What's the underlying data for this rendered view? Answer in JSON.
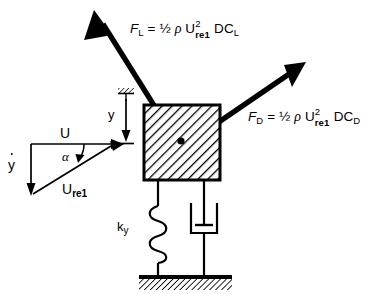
{
  "figure": {
    "type": "free-body-diagram",
    "background_color": "#ffffff",
    "line_color": "#000000"
  },
  "forces": {
    "lift": {
      "name": "lift-force",
      "symbol": "F",
      "symbol_sub": "L",
      "equals": "=",
      "half": "½",
      "rho": "ρ",
      "velocity": "U",
      "velocity_sup": "2",
      "velocity_sub": "re1",
      "tail": "DC",
      "tail_sub": "L",
      "full_text": "F_L = ½ ρ U²_re1 DC_L",
      "direction": "up-left"
    },
    "drag": {
      "name": "drag-force",
      "symbol": "F",
      "symbol_sub": "D",
      "equals": "=",
      "half": "½",
      "rho": "ρ",
      "velocity": "U",
      "velocity_sup": "2",
      "velocity_sub": "re1",
      "tail": "DC",
      "tail_sub": "D",
      "full_text": "F_D = ½ ρ U²_re1 DC_D",
      "direction": "up-right"
    }
  },
  "velocity_triangle": {
    "free_stream": {
      "label": "U",
      "description": "horizontal-free-stream-velocity"
    },
    "body_velocity": {
      "label": "y",
      "has_overdot": true,
      "description": "vertical-body-velocity-y-dot"
    },
    "relative_velocity": {
      "label": "U",
      "sub": "re1",
      "description": "relative-velocity-vector"
    },
    "angle": {
      "label": "α",
      "description": "angle-of-attack"
    }
  },
  "displacement": {
    "label": "y",
    "description": "vertical-displacement-from-ceiling-anchor"
  },
  "spring": {
    "label": "k",
    "sub": "y",
    "description": "vertical-spring-stiffness",
    "coils": 5
  },
  "damper": {
    "description": "viscous-dashpot-damper"
  },
  "mass": {
    "description": "hatched-square-bluff-body",
    "center_marker": "center-of-mass-dot"
  },
  "ground": {
    "description": "hatched-fixed-ground-support"
  },
  "ceiling": {
    "description": "hatched-fixed-ceiling-reference-anchor"
  }
}
